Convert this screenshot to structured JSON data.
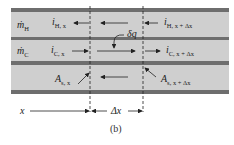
{
  "figure": {
    "caption": "(b)",
    "streams": {
      "hot": {
        "symbol": "ṁ",
        "subscript": "H"
      },
      "cold": {
        "symbol": "ṁ",
        "subscript": "C"
      }
    },
    "labels": {
      "i_H_x": {
        "main": "i",
        "sub": "H, x"
      },
      "i_H_xdx": {
        "main": "i",
        "sub": "H, x + Δx"
      },
      "i_C_x": {
        "main": "i",
        "sub": "C, x"
      },
      "i_C_xdx": {
        "main": "i",
        "sub": "C, x + Δx"
      },
      "A_s_x": {
        "main": "A",
        "sub": "s, x"
      },
      "A_s_xdx": {
        "main": "A",
        "sub": "s, x + Δx"
      },
      "dq": "δq",
      "x": "x",
      "dx": "Δx"
    },
    "colors": {
      "band_light": "#cfcfcf",
      "band_dark": "#6e6e6e",
      "ink": "#222222"
    }
  }
}
